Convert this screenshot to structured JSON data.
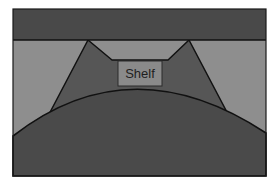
{
  "diagram": {
    "type": "cross-section schematic",
    "colors": {
      "background": "#ffffff",
      "top_band": "#494949",
      "light_region": "#8e8e8e",
      "mound": "#565656",
      "bottom_region": "#4a4a4a",
      "shelf_box": "#8a8a8a",
      "outline": "#111111"
    },
    "labels": {
      "shelf": "Shelf"
    }
  }
}
